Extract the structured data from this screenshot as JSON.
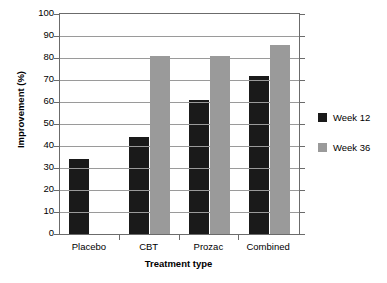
{
  "chart_data": {
    "type": "bar",
    "title": "",
    "subtitle": "",
    "xlabel": "Treatment type",
    "ylabel": "Improvement (%)",
    "categories": [
      "Placebo",
      "CBT",
      "Prozac",
      "Combined"
    ],
    "series": [
      {
        "name": "Week 12",
        "color": "#1a1a1a",
        "values": [
          34,
          44,
          61,
          72
        ]
      },
      {
        "name": "Week 36",
        "color": "#9a9a9a",
        "values": [
          0,
          81,
          81,
          86
        ]
      }
    ],
    "ylim": [
      0,
      100
    ],
    "ytick_step": 10,
    "yticks": [
      0,
      10,
      20,
      30,
      40,
      50,
      60,
      70,
      80,
      90,
      100
    ],
    "ytick_labels": [
      "0",
      "10",
      "20",
      "30",
      "40",
      "50",
      "60",
      "70",
      "80",
      "90",
      "100"
    ],
    "grid": "horizontal",
    "legend_position": "right",
    "legend_entries": [
      "Week 12",
      "Week 36"
    ]
  }
}
